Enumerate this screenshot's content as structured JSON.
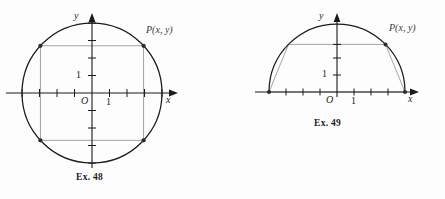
{
  "page": {
    "width": 445,
    "height": 199,
    "background_color": "#fdfdfd"
  },
  "palette": {
    "curve_color": "#1a1a1a",
    "axis_color": "#1a1a1a",
    "inscribed_shape_color": "#9a9a9a",
    "vertex_dot_color": "#2b2b2b",
    "text_color": "#1e1e1e",
    "label_color": "#3a3a3a"
  },
  "figures": [
    {
      "id": "ex48",
      "caption": "Ex. 48",
      "shape": "circle-with-inscribed-rectangle",
      "origin": {
        "x": 92,
        "y": 93
      },
      "unit_px": 17.5,
      "radius_units": 4,
      "axes": {
        "x_label": "x",
        "y_label": "y",
        "origin_label": "O",
        "x_unit_label": "1",
        "y_unit_label": "1",
        "x_ticks": [
          -4,
          -3,
          -2,
          -1,
          1,
          2,
          3,
          4
        ],
        "y_ticks": [
          -4,
          -3,
          -2,
          -1,
          1,
          2,
          3,
          4
        ],
        "x_range": [
          -4.9,
          4.9
        ],
        "y_range": [
          -4.6,
          4.7
        ]
      },
      "point_label": "P(x, y)",
      "inscribed_rectangle": {
        "half_width_units": 2.95,
        "half_height_units": 2.7,
        "vertices": [
          {
            "x": 2.95,
            "y": 2.7
          },
          {
            "x": -2.95,
            "y": 2.7
          },
          {
            "x": -2.95,
            "y": -2.7
          },
          {
            "x": 2.95,
            "y": -2.7
          }
        ]
      }
    },
    {
      "id": "ex49",
      "caption": "Ex. 49",
      "shape": "semicircle-with-inscribed-trapezoid",
      "origin": {
        "x": 337,
        "y": 92
      },
      "unit_px": 17.0,
      "radius_units": 4,
      "axes": {
        "x_label": "x",
        "y_label": "y",
        "origin_label": "O",
        "x_unit_label": "1",
        "y_unit_label": "1",
        "x_ticks": [
          -3,
          -2,
          -1,
          1,
          2,
          3
        ],
        "y_ticks": [
          1,
          2,
          3
        ],
        "x_range": [
          -4.8,
          4.9
        ],
        "y_range": [
          -0.4,
          4.7
        ]
      },
      "point_label": "P(x, y)",
      "inscribed_trapezoid": {
        "base_half_width_units": 4,
        "top_half_width_units": 2.85,
        "top_height_units": 2.8,
        "vertices": [
          {
            "x": -4,
            "y": 0
          },
          {
            "x": -2.85,
            "y": 2.8
          },
          {
            "x": 2.85,
            "y": 2.8
          },
          {
            "x": 4,
            "y": 0
          }
        ]
      }
    }
  ]
}
